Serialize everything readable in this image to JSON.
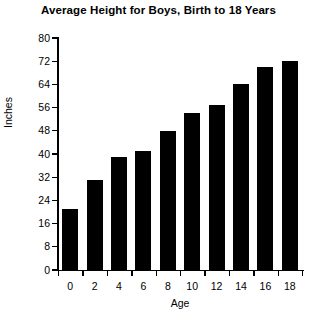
{
  "chart_data": {
    "type": "bar",
    "title": "Average Height for Boys, Birth to 18 Years",
    "xlabel": "Age",
    "ylabel": "Inches",
    "categories": [
      "0",
      "2",
      "4",
      "6",
      "8",
      "10",
      "12",
      "14",
      "16",
      "18"
    ],
    "values": [
      21,
      31,
      39,
      41,
      48,
      54,
      57,
      64,
      70,
      72
    ],
    "ylim": [
      0,
      80
    ],
    "ytick_values": [
      0,
      8,
      16,
      24,
      32,
      40,
      48,
      56,
      64,
      72,
      80
    ],
    "ytick_labels": [
      "0",
      "8",
      "16",
      "24",
      "32",
      "40",
      "48",
      "56",
      "64",
      "72",
      "80"
    ],
    "xtick_labels": [
      "0",
      "2",
      "4",
      "6",
      "8",
      "10",
      "12",
      "14",
      "16",
      "18"
    ],
    "grid": false,
    "legend": false,
    "legend_position": "none",
    "bar_color": "#000000",
    "background_color": "#ffffff",
    "text_color": "#000000"
  }
}
